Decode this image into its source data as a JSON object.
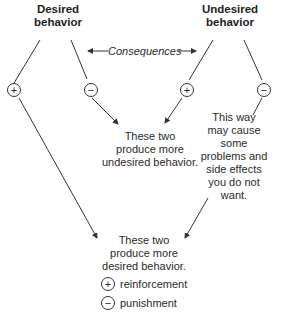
{
  "nodes": {
    "desired": {
      "line1": "Desired",
      "line2": "behavior"
    },
    "undesired": {
      "line1": "Undesired",
      "line2": "behavior"
    }
  },
  "consequences_label": "Consequences",
  "symbols": {
    "plus": "+",
    "minus": "−"
  },
  "outcomes": {
    "undesired": [
      "These two",
      "produce more",
      "undesired behavior."
    ],
    "side_effects": [
      "This way",
      "may cause",
      "some",
      "problems and",
      "side effects",
      "you do not",
      "want."
    ],
    "desired": [
      "These two",
      "produce more",
      "desired behavior."
    ]
  },
  "legend": [
    {
      "symbol": "+",
      "label": "reinforcement"
    },
    {
      "symbol": "−",
      "label": "punishment"
    }
  ],
  "colors": {
    "line": "#333333",
    "text": "#2a2a2a"
  }
}
